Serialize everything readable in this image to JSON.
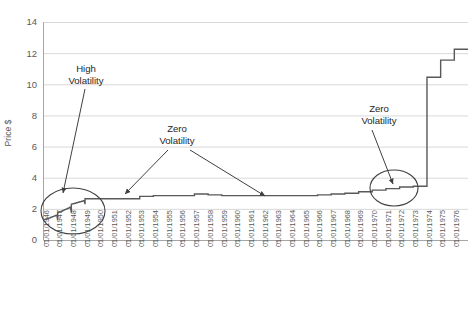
{
  "chart_data": {
    "type": "line",
    "title": "",
    "xlabel": "",
    "ylabel": "Price $",
    "ylim": [
      0,
      14
    ],
    "ytick_step": 2,
    "yticks": [
      "0",
      "2",
      "4",
      "6",
      "8",
      "10",
      "12",
      "14"
    ],
    "grid": true,
    "legend": "none",
    "categories": [
      "01/01/1946",
      "01/01/1947",
      "01/01/1948",
      "01/01/1949",
      "01/01/1950",
      "01/01/1951",
      "01/01/1952",
      "01/01/1953",
      "01/01/1954",
      "01/01/1955",
      "01/01/1956",
      "01/01/1957",
      "01/01/1958",
      "01/01/1959",
      "01/01/1960",
      "01/01/1961",
      "01/01/1962",
      "01/01/1963",
      "01/01/1964",
      "01/01/1965",
      "01/01/1966",
      "01/01/1967",
      "01/01/1968",
      "01/01/1969",
      "01/01/1970",
      "01/01/1971",
      "01/01/1972",
      "01/01/1973",
      "01/01/1974",
      "01/01/1975",
      "01/01/1976"
    ],
    "values": [
      1.3,
      1.75,
      2.3,
      2.65,
      2.65,
      2.65,
      2.65,
      2.8,
      2.85,
      2.85,
      2.85,
      2.95,
      2.9,
      2.85,
      2.85,
      2.85,
      2.85,
      2.85,
      2.85,
      2.85,
      2.9,
      2.95,
      3.0,
      3.1,
      3.2,
      3.3,
      3.4,
      3.45,
      10.45,
      11.55,
      12.25
    ],
    "series_color": "#595959",
    "annotations": [
      {
        "id": "high-volatility",
        "text_line1": "High",
        "text_line2": "Volatility",
        "target": "early-steps-1946-1948"
      },
      {
        "id": "zero-volatility-mid",
        "text_line1": "Zero",
        "text_line2": "Volatility",
        "target": "flat-plateau"
      },
      {
        "id": "zero-volatility-right",
        "text_line1": "Zero",
        "text_line2": "Volatility",
        "target": "pre-spike-plateau-1973"
      }
    ],
    "highlight_ellipses": [
      {
        "id": "left-ellipse",
        "label": "high-volatility-region"
      },
      {
        "id": "right-ellipse",
        "label": "zero-volatility-region"
      }
    ]
  },
  "axes": {
    "y_label": "Price $"
  },
  "annotations": {
    "high_volatility": {
      "line1": "High",
      "line2": "Volatility"
    },
    "zero_volatility_mid": {
      "line1": "Zero",
      "line2": "Volatility"
    },
    "zero_volatility_right": {
      "line1": "Zero",
      "line2": "Volatility"
    }
  }
}
